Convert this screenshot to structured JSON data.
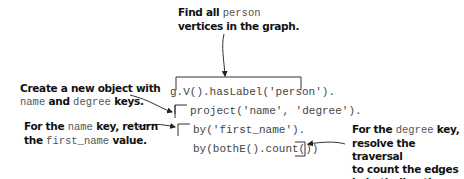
{
  "annotations": {
    "top": {
      "pre": "Find all ",
      "code": "person",
      "post": "vertices in the graph."
    },
    "left1": {
      "line1": "Create a new object with",
      "code1": "name",
      "mid": " and ",
      "code2": "degree",
      "post": " keys."
    },
    "left2": {
      "pre": "For the ",
      "code1": "name",
      "mid": " key, return",
      "line2pre": "the ",
      "code2": "first_name",
      "post": " value."
    },
    "right": {
      "pre": "For the ",
      "code": "degree",
      "post": " key,",
      "line2": "resolve the traversal",
      "line3": "to count the edges",
      "line4": "in both directions."
    }
  },
  "code_lines": [
    "g.V().hasLabel('person').",
    "project('name', 'degree').",
    "by('first_name').",
    "by(bothE().count())"
  ]
}
